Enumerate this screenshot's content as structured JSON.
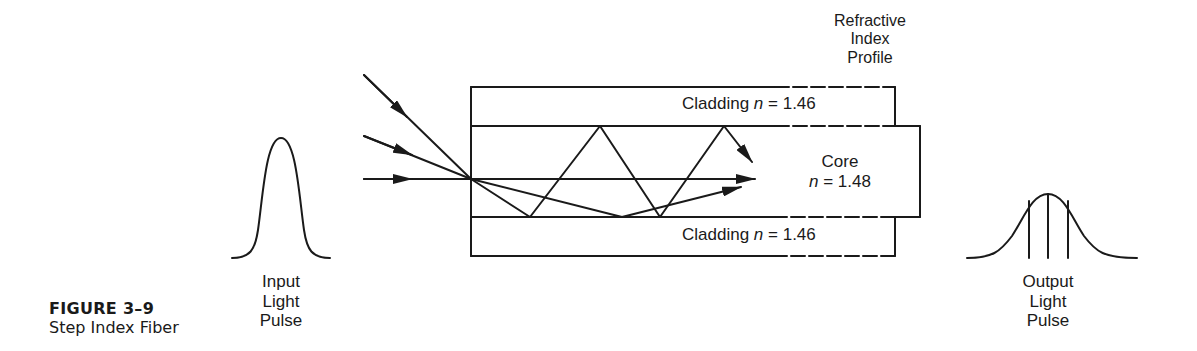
{
  "figure": {
    "number": "FIGURE 3–9",
    "title": "Step Index Fiber"
  },
  "labels": {
    "input_pulse": [
      "Input",
      "Light",
      "Pulse"
    ],
    "output_pulse": [
      "Output",
      "Light",
      "Pulse"
    ],
    "profile": [
      "Refractive",
      "Index",
      "Profile"
    ],
    "cladding_top": {
      "name": "Cladding",
      "n_symbol": "n",
      "eq": " = 1.46"
    },
    "cladding_bottom": {
      "name": "Cladding",
      "n_symbol": "n",
      "eq": " = 1.46"
    },
    "core": {
      "name": "Core",
      "n_symbol": "n",
      "eq": " = 1.48"
    }
  },
  "colors": {
    "ink": "#1a1a1a",
    "background": "#ffffff"
  }
}
